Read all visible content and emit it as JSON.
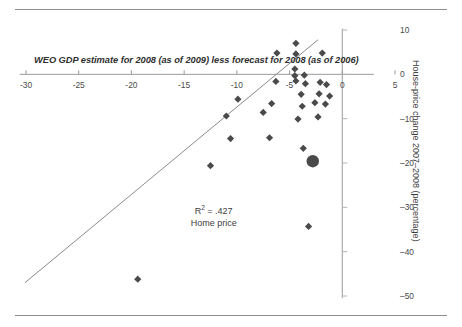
{
  "chart_data": {
    "type": "scatter",
    "title": "",
    "xlabel": "WEO GDP estimate for 2008 (as of 2009) less forecast for 2008 (as of 2006)",
    "ylabel": "House-price change 2007–2008 (percentage)",
    "xlim": [
      -30,
      5
    ],
    "ylim": [
      -50,
      10
    ],
    "xticks": [
      -30,
      -25,
      -20,
      -15,
      -10,
      -5,
      0,
      5
    ],
    "xtick_labels": [
      "-30",
      "-25",
      "-20",
      "-15",
      "-10",
      "-5",
      "0",
      "5"
    ],
    "yticks": [
      10,
      0,
      -10,
      -20,
      -30,
      -40,
      -50
    ],
    "ytick_labels": [
      "10",
      "0",
      "–10",
      "–20",
      "–30",
      "–40",
      "–50"
    ],
    "grid": false,
    "legend": null,
    "annotations": [
      {
        "text": "R² = .427",
        "x": -12.2,
        "y": -30.5
      },
      {
        "text": "Home price",
        "x": -12.2,
        "y": -33.8
      }
    ],
    "trendline": {
      "x0": -30.1,
      "y0": -47.0,
      "x1": -2.3,
      "y1": 7.8
    },
    "series": [
      {
        "name": "countries",
        "marker": "diamond",
        "color": "#4a4a4a",
        "points": [
          {
            "x": -4.4,
            "y": 7.0
          },
          {
            "x": -6.2,
            "y": 4.8
          },
          {
            "x": -4.4,
            "y": 4.6
          },
          {
            "x": -1.9,
            "y": 4.8
          },
          {
            "x": -4.5,
            "y": 1.2
          },
          {
            "x": -4.5,
            "y": -0.3
          },
          {
            "x": -3.6,
            "y": -0.2
          },
          {
            "x": -6.3,
            "y": -1.6
          },
          {
            "x": -4.4,
            "y": -1.5
          },
          {
            "x": -3.5,
            "y": -2.1
          },
          {
            "x": -2.1,
            "y": -1.8
          },
          {
            "x": -1.5,
            "y": -2.3
          },
          {
            "x": -9.9,
            "y": -5.6
          },
          {
            "x": -3.9,
            "y": -4.5
          },
          {
            "x": -2.2,
            "y": -4.4
          },
          {
            "x": -1.2,
            "y": -4.9
          },
          {
            "x": -6.7,
            "y": -6.6
          },
          {
            "x": -3.8,
            "y": -7.2
          },
          {
            "x": -2.6,
            "y": -6.4
          },
          {
            "x": -1.6,
            "y": -6.7
          },
          {
            "x": -11.0,
            "y": -9.4
          },
          {
            "x": -7.5,
            "y": -8.6
          },
          {
            "x": -4.2,
            "y": -10.1
          },
          {
            "x": -2.3,
            "y": -9.6
          },
          {
            "x": -10.6,
            "y": -14.5
          },
          {
            "x": -6.9,
            "y": -14.3
          },
          {
            "x": -3.7,
            "y": -16.7
          },
          {
            "x": -12.5,
            "y": -20.6
          },
          {
            "x": -3.2,
            "y": -34.3
          },
          {
            "x": -19.4,
            "y": -46.2
          }
        ]
      },
      {
        "name": "highlighted",
        "marker": "circle",
        "color": "#4a4a4a",
        "points": [
          {
            "x": -2.8,
            "y": -19.6
          }
        ]
      }
    ]
  }
}
